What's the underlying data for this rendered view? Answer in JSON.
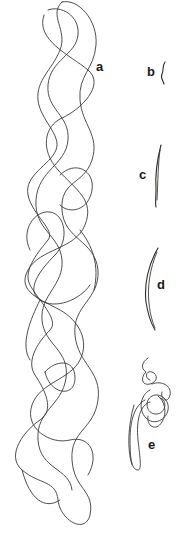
{
  "figure": {
    "panels": [
      {
        "id": "a",
        "label": "a",
        "description": "long extended tangled strand"
      },
      {
        "id": "b",
        "label": "b",
        "description": "very short wavy fragment"
      },
      {
        "id": "c",
        "label": "c",
        "description": "short slightly curved fiber"
      },
      {
        "id": "d",
        "label": "d",
        "description": "curved crescent-shaped double fiber"
      },
      {
        "id": "e",
        "label": "e",
        "description": "coiled knot with a looping tail"
      }
    ],
    "stroke_color": "#3a3a3a",
    "label_color": "#1a1a1a",
    "background": "#ffffff"
  }
}
